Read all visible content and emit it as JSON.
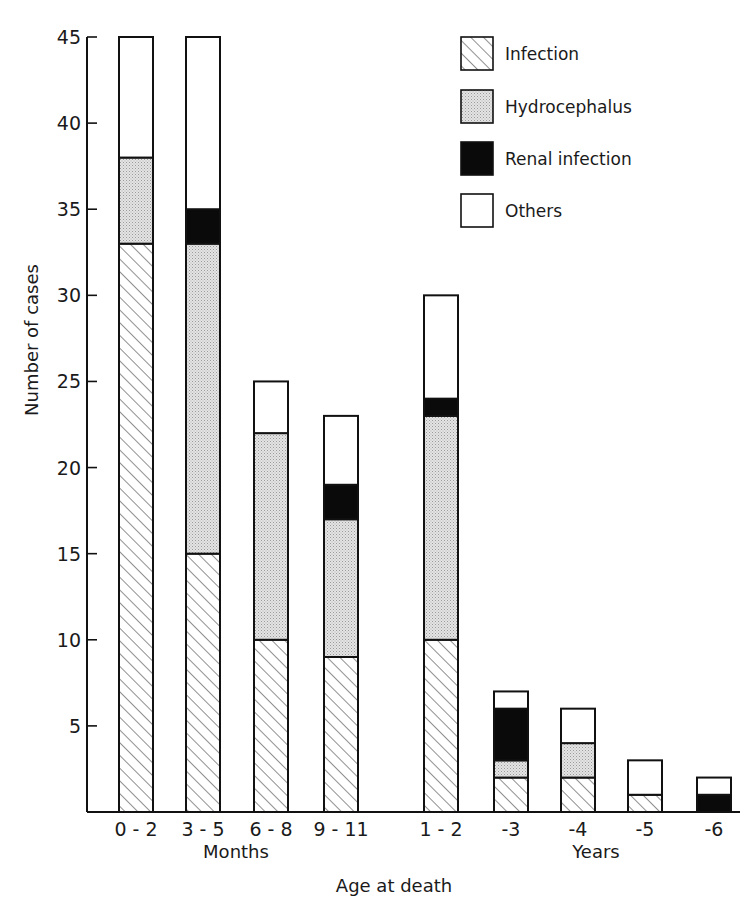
{
  "chart_data": {
    "type": "bar",
    "stacked": true,
    "title": "",
    "xlabel": "Age at death",
    "ylabel": "Number of cases",
    "ylim": [
      0,
      45
    ],
    "yticks": [
      5,
      10,
      15,
      20,
      25,
      30,
      35,
      40,
      45
    ],
    "categories": [
      "0-2",
      "3-5",
      "6-8",
      "9-11",
      "1-2",
      "-3",
      "-4",
      "-5",
      "-6"
    ],
    "category_groups": [
      {
        "label": "Months",
        "categories": [
          "0-2",
          "3-5",
          "6-8",
          "9-11"
        ]
      },
      {
        "label": "Years",
        "categories": [
          "1-2",
          "-3",
          "-4",
          "-5",
          "-6"
        ]
      }
    ],
    "series": [
      {
        "name": "Infection",
        "pattern": "diagonal-hatch",
        "values": [
          33,
          15,
          10,
          9,
          10,
          2,
          2,
          1,
          0
        ]
      },
      {
        "name": "Hydrocephalus",
        "pattern": "stipple",
        "values": [
          5,
          18,
          12,
          8,
          13,
          1,
          2,
          0,
          0
        ]
      },
      {
        "name": "Renal infection",
        "pattern": "solid-black",
        "values": [
          0,
          2,
          0,
          2,
          1,
          3,
          0,
          0,
          1
        ]
      },
      {
        "name": "Others",
        "pattern": "white",
        "values": [
          7,
          10,
          3,
          4,
          6,
          1,
          2,
          2,
          1
        ]
      }
    ],
    "totals": [
      45,
      45,
      25,
      23,
      30,
      7,
      6,
      3,
      2
    ],
    "grid": false,
    "legend_position": "top-right"
  },
  "colors": {
    "outline": "#111111",
    "stipple": "#d6d6d6",
    "renal": "#0a0a0a",
    "others": "#ffffff"
  }
}
